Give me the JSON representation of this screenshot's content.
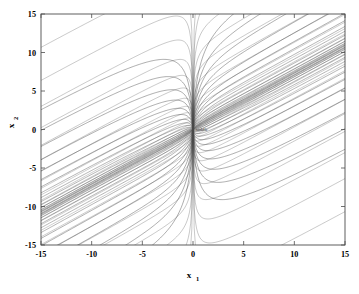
{
  "chart_data": {
    "type": "line",
    "title": "",
    "subtitle": "",
    "xlabel": "x",
    "xlabel_sub": "1",
    "ylabel": "x",
    "ylabel_sub": "2",
    "xlim": [
      -15,
      15
    ],
    "ylim": [
      -15,
      15
    ],
    "xticks": [
      -15,
      -10,
      -5,
      0,
      5,
      10,
      15
    ],
    "yticks": [
      -15,
      -10,
      -5,
      0,
      5,
      10,
      15
    ],
    "xticklabels": [
      "-15",
      "-10",
      "-5",
      "0",
      "5",
      "10",
      "15"
    ],
    "yticklabels": [
      "-15",
      "-10",
      "-5",
      "0",
      "5",
      "10",
      "15"
    ],
    "grid": false,
    "legend": null,
    "box": true,
    "equilibrium": {
      "x": 0,
      "y": 0,
      "label": "saddle"
    },
    "line_color": "#4a4a4a",
    "background": "#ffffff",
    "series": [
      {
        "name": "trajectory-1",
        "slow_slope": 0.72,
        "offset": 14.0,
        "branch": "upper"
      },
      {
        "name": "trajectory-2",
        "slow_slope": 0.72,
        "offset": 11.2,
        "branch": "upper"
      },
      {
        "name": "trajectory-3",
        "slow_slope": 0.72,
        "offset": 9.0,
        "branch": "upper"
      },
      {
        "name": "trajectory-4",
        "slow_slope": 0.72,
        "offset": 7.2,
        "branch": "upper"
      },
      {
        "name": "trajectory-5",
        "slow_slope": 0.72,
        "offset": 5.7,
        "branch": "upper"
      },
      {
        "name": "trajectory-6",
        "slow_slope": 0.72,
        "offset": 4.5,
        "branch": "upper"
      },
      {
        "name": "trajectory-7",
        "slow_slope": 0.72,
        "offset": 3.5,
        "branch": "upper"
      },
      {
        "name": "trajectory-8",
        "slow_slope": 0.72,
        "offset": 2.7,
        "branch": "upper"
      },
      {
        "name": "trajectory-9",
        "slow_slope": 0.72,
        "offset": 2.05,
        "branch": "upper"
      },
      {
        "name": "trajectory-10",
        "slow_slope": 0.72,
        "offset": 1.5,
        "branch": "upper"
      },
      {
        "name": "trajectory-11",
        "slow_slope": 0.72,
        "offset": 1.05,
        "branch": "upper"
      },
      {
        "name": "trajectory-12",
        "slow_slope": 0.72,
        "offset": 0.7,
        "branch": "upper"
      },
      {
        "name": "trajectory-13",
        "slow_slope": 0.72,
        "offset": 0.42,
        "branch": "upper"
      },
      {
        "name": "trajectory-14",
        "slow_slope": 0.72,
        "offset": 0.22,
        "branch": "upper"
      },
      {
        "name": "trajectory-15",
        "slow_slope": 0.72,
        "offset": 0.09,
        "branch": "upper"
      },
      {
        "name": "trajectory-16",
        "slow_slope": 0.72,
        "offset": -0.09,
        "branch": "lower"
      },
      {
        "name": "trajectory-17",
        "slow_slope": 0.72,
        "offset": -0.22,
        "branch": "lower"
      },
      {
        "name": "trajectory-18",
        "slow_slope": 0.72,
        "offset": -0.42,
        "branch": "lower"
      },
      {
        "name": "trajectory-19",
        "slow_slope": 0.72,
        "offset": -0.7,
        "branch": "lower"
      },
      {
        "name": "trajectory-20",
        "slow_slope": 0.72,
        "offset": -1.05,
        "branch": "lower"
      },
      {
        "name": "trajectory-21",
        "slow_slope": 0.72,
        "offset": -1.5,
        "branch": "lower"
      },
      {
        "name": "trajectory-22",
        "slow_slope": 0.72,
        "offset": -2.05,
        "branch": "lower"
      },
      {
        "name": "trajectory-23",
        "slow_slope": 0.72,
        "offset": -2.7,
        "branch": "lower"
      },
      {
        "name": "trajectory-24",
        "slow_slope": 0.72,
        "offset": -3.5,
        "branch": "lower"
      },
      {
        "name": "trajectory-25",
        "slow_slope": 0.72,
        "offset": -4.5,
        "branch": "lower"
      },
      {
        "name": "trajectory-26",
        "slow_slope": 0.72,
        "offset": -5.7,
        "branch": "lower"
      },
      {
        "name": "trajectory-27",
        "slow_slope": 0.72,
        "offset": -7.2,
        "branch": "lower"
      },
      {
        "name": "trajectory-28",
        "slow_slope": 0.72,
        "offset": -9.0,
        "branch": "lower"
      },
      {
        "name": "trajectory-29",
        "slow_slope": 0.72,
        "offset": -11.2,
        "branch": "lower"
      },
      {
        "name": "trajectory-30",
        "slow_slope": 0.72,
        "offset": -14.0,
        "branch": "lower"
      }
    ]
  },
  "plot": {
    "geometry": {
      "left": 41,
      "top": 14,
      "right": 345,
      "bottom": 245,
      "origin_x": 193,
      "origin_y": 129.5
    }
  },
  "annotations": {
    "equilibrium_label": "saddle"
  }
}
